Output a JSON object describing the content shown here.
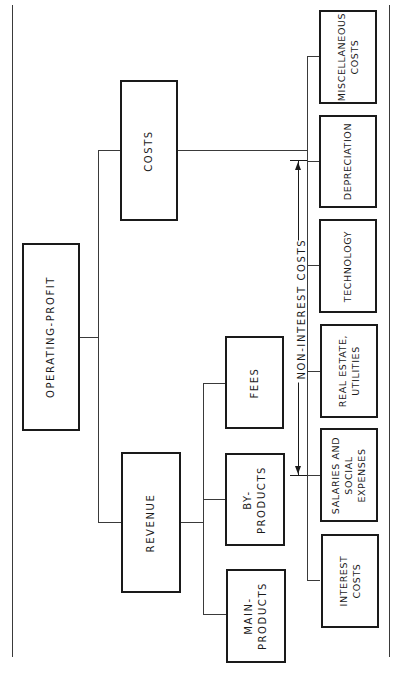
{
  "diagram": {
    "root": {
      "label": "OPERATING-PROFIT"
    },
    "level1": [
      {
        "label": "COSTS"
      },
      {
        "label": "REVENUE"
      }
    ],
    "revenue_children": [
      {
        "label": "FEES"
      },
      {
        "label": "BY-\nPRODUCTS"
      },
      {
        "label": "MAIN-\nPRODUCTS"
      }
    ],
    "cost_children": [
      {
        "label": "MISCELLANEOUS\nCOSTS"
      },
      {
        "label": "DEPRECIATION"
      },
      {
        "label": "TECHNOLOGY"
      },
      {
        "label": "REAL ESTATE,\nUTILITIES"
      },
      {
        "label": "SALARIES AND\nSOCIAL\nEXPENSES"
      },
      {
        "label": "INTEREST\nCOSTS"
      }
    ],
    "annotation": {
      "label": "NON-INTEREST  COSTS"
    },
    "orientation": "rotated 90° counter-clockwise"
  }
}
